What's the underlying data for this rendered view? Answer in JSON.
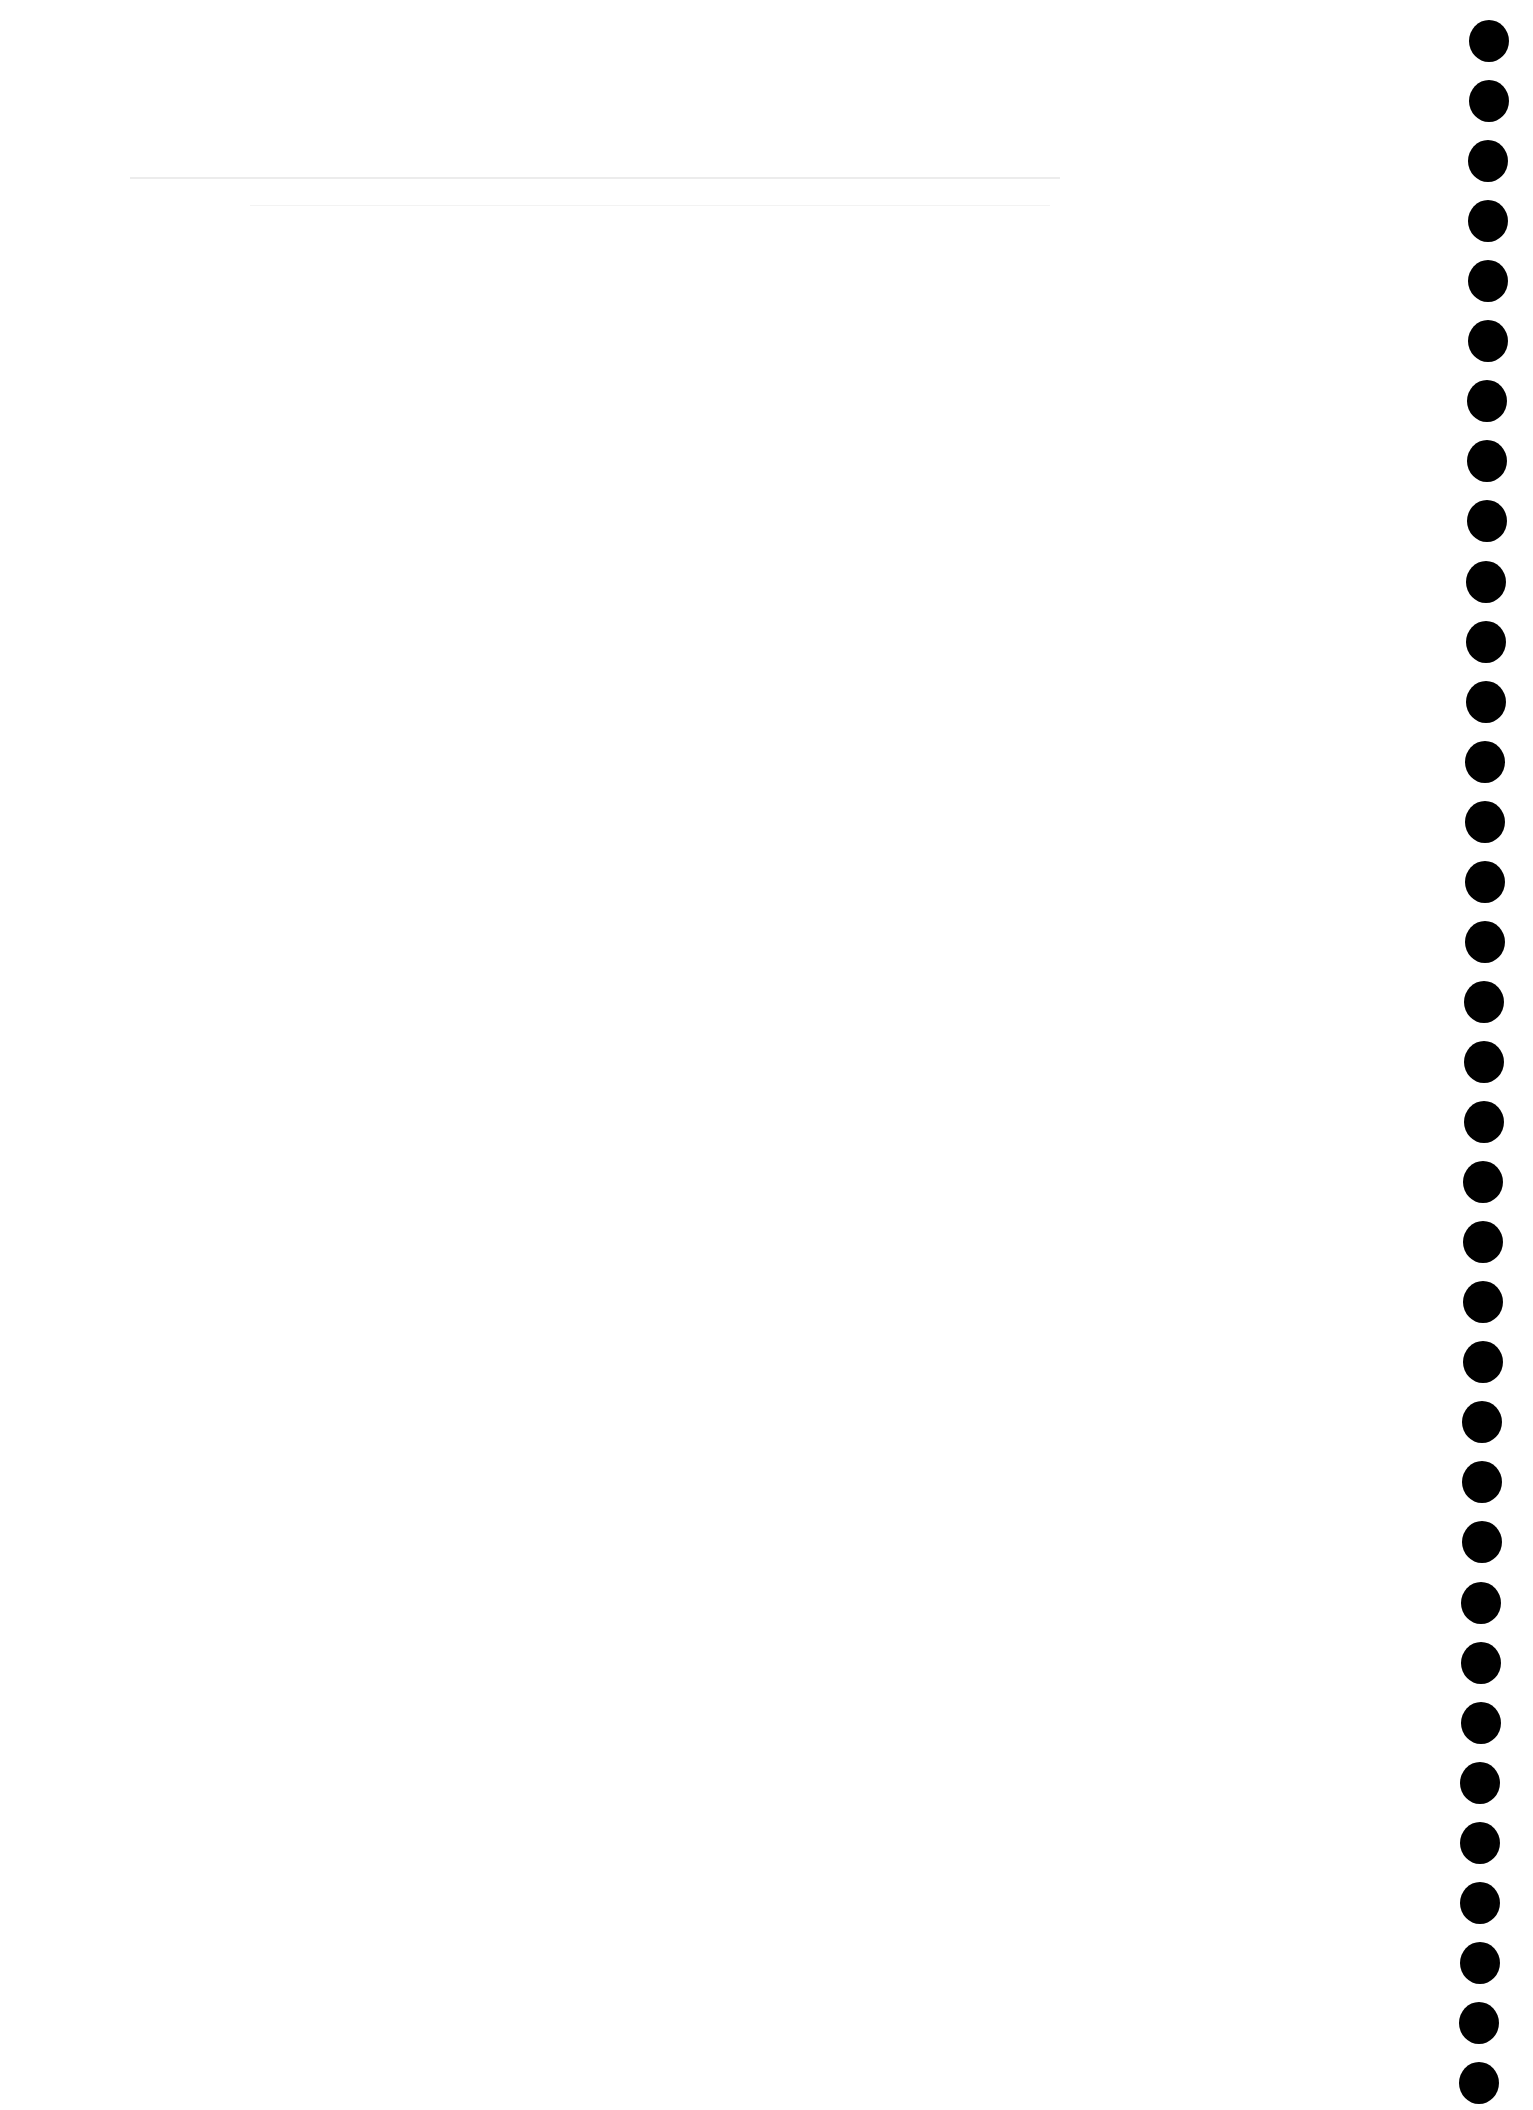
{
  "page": {
    "type": "blank scanned sheet",
    "background": "#ffffff",
    "header_text": "",
    "body_text": ""
  },
  "punch_holes": {
    "count": 35,
    "color": "#000000",
    "diameter_px": 40
  }
}
